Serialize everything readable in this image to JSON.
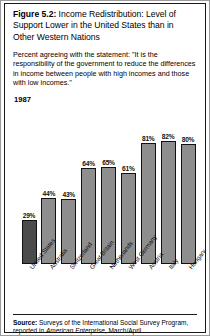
{
  "figure": {
    "number_label": "Figure 5.2:",
    "title": " Income Redistribution: Level of Support Lower in the United States than in Other Western Nations",
    "subtitle": "Percent agreeing with the statement: \"It is the responsibility of the government to reduce the differences in income between people with high incomes and those with low incomes.\"",
    "year": "1987"
  },
  "source": {
    "label": "Source:",
    "text_before_italic": " Surveys of the International Social Survey Program, reported in ",
    "italic_text": "American Enterprise",
    "text_after_italic": ", March/April"
  },
  "colors": {
    "bar_fill": "#8e8e8e",
    "bar_highlight_fill": "#4b4b4b",
    "bar_outline": "#111111",
    "frame": "#1a1a1a",
    "text": "#000000"
  },
  "chart_data": {
    "type": "bar",
    "title": "Income Redistribution: Level of Support Lower in the United States than in Other Western Nations",
    "subtitle": "Percent agreeing with the statement: \"It is the responsibility of the government to reduce the differences in income between people with high incomes and those with low incomes.\"",
    "xlabel": "",
    "ylabel": "",
    "ylim": [
      0,
      100
    ],
    "grid": false,
    "legend": "none",
    "year": "1987",
    "value_suffix": "%",
    "categories": [
      "United States",
      "Australia",
      "Switzerland",
      "Great Britain",
      "Netherlands",
      "West Germany",
      "Austria",
      "Italy",
      "Hungary"
    ],
    "values": [
      29,
      44,
      43,
      64,
      65,
      61,
      81,
      82,
      80
    ],
    "value_labels": [
      "29%",
      "44%",
      "43%",
      "64%",
      "65%",
      "61%",
      "81%",
      "82%",
      "80%"
    ],
    "highlight_index": 0
  }
}
